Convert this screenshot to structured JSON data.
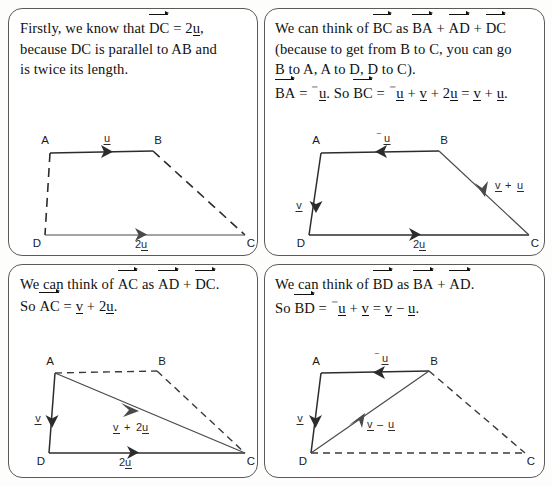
{
  "page": {
    "panel_count": 4
  },
  "panels": [
    {
      "id": "panel-1",
      "name": "panel-dc-equals-2u",
      "text_lines": [
        "Firstly, we know that DC = 2u,",
        "because DC is parallel to AB and",
        "is twice its length."
      ],
      "statement_vector": "DC",
      "statement_result": "2u",
      "diagram": {
        "name": "trapezium-ab-dc",
        "vertices": {
          "A": "A",
          "B": "B",
          "C": "C",
          "D": "D"
        },
        "edge_labels": {
          "AB": "u",
          "DC": "2u"
        },
        "edges": [
          {
            "from": "A",
            "to": "B",
            "style": "solid",
            "arrow": "mid-right",
            "label": "u"
          },
          {
            "from": "A",
            "to": "D",
            "style": "dashed",
            "arrow": "none",
            "label": ""
          },
          {
            "from": "B",
            "to": "C",
            "style": "dashed",
            "arrow": "none",
            "label": ""
          },
          {
            "from": "D",
            "to": "C",
            "style": "solid",
            "arrow": "mid-right",
            "label": "2u"
          }
        ]
      }
    },
    {
      "id": "panel-2",
      "name": "panel-bc-decomposition",
      "text_lines": [
        "We can think of BC as  BA + AD + DC",
        "(because to get from B to C, you can go",
        "B to A, A to D, D to C).",
        "BA = ⁻u.  So BC = ⁻u + v + 2u = v + u."
      ],
      "diagram": {
        "name": "trapezium-bc-route",
        "vertices": {
          "A": "A",
          "B": "B",
          "C": "C",
          "D": "D"
        },
        "edge_labels": {
          "BA": "⁻u",
          "AD": "v",
          "DC": "2u",
          "BC": "v + u"
        },
        "edges": [
          {
            "from": "B",
            "to": "A",
            "style": "solid",
            "arrow": "mid-left",
            "label": "⁻u"
          },
          {
            "from": "A",
            "to": "D",
            "style": "solid",
            "arrow": "mid-down",
            "label": "v"
          },
          {
            "from": "D",
            "to": "C",
            "style": "solid",
            "arrow": "mid-right",
            "label": "2u"
          },
          {
            "from": "B",
            "to": "C",
            "style": "thin",
            "arrow": "mid-diag",
            "label": "v + u"
          }
        ]
      }
    },
    {
      "id": "panel-3",
      "name": "panel-ac-decomposition",
      "text_lines": [
        "We can think of AC as  AD + DC.",
        "So  AC = v + 2u."
      ],
      "diagram": {
        "name": "trapezium-ac-route",
        "vertices": {
          "A": "A",
          "B": "B",
          "C": "C",
          "D": "D"
        },
        "edge_labels": {
          "AD": "v",
          "DC": "2u",
          "AC": "v + 2u"
        },
        "edges": [
          {
            "from": "A",
            "to": "B",
            "style": "dashed",
            "arrow": "none",
            "label": ""
          },
          {
            "from": "B",
            "to": "C",
            "style": "dashed",
            "arrow": "none",
            "label": ""
          },
          {
            "from": "A",
            "to": "D",
            "style": "solid",
            "arrow": "mid-down",
            "label": "v"
          },
          {
            "from": "D",
            "to": "C",
            "style": "solid",
            "arrow": "mid-right",
            "label": "2u"
          },
          {
            "from": "A",
            "to": "C",
            "style": "thin",
            "arrow": "mid-diag",
            "label": "v + 2u"
          }
        ]
      }
    },
    {
      "id": "panel-4",
      "name": "panel-bd-decomposition",
      "text_lines": [
        "We can think of BD as  BA + AD.",
        "So  BD = ⁻u + v = v − u."
      ],
      "diagram": {
        "name": "trapezium-bd-route",
        "vertices": {
          "A": "A",
          "B": "B",
          "C": "C",
          "D": "D"
        },
        "edge_labels": {
          "BA": "⁻u",
          "AD": "v",
          "BD": "v − u"
        },
        "edges": [
          {
            "from": "B",
            "to": "A",
            "style": "solid",
            "arrow": "mid-left",
            "label": "⁻u"
          },
          {
            "from": "A",
            "to": "D",
            "style": "solid",
            "arrow": "mid-down",
            "label": "v"
          },
          {
            "from": "B",
            "to": "C",
            "style": "dashed",
            "arrow": "none",
            "label": ""
          },
          {
            "from": "D",
            "to": "C",
            "style": "dashed",
            "arrow": "none",
            "label": ""
          },
          {
            "from": "B",
            "to": "D",
            "style": "thin",
            "arrow": "mid-diag",
            "label": "v − u"
          }
        ]
      }
    }
  ],
  "labels": {
    "A": "A",
    "B": "B",
    "C": "C",
    "D": "D",
    "u": "u",
    "two_u": "2u",
    "v": "v",
    "neg_u": "u",
    "v_plus_u_v": "v",
    "v_plus_u_op": "+",
    "v_plus_u_u": "u",
    "v_plus_2u_v": "v",
    "v_plus_2u_op": "+",
    "v_plus_2u_2u": "2u",
    "v_minus_u_v": "v",
    "v_minus_u_op": "–",
    "v_minus_u_u": "u",
    "neg_sign": "⁻"
  },
  "text": {
    "p1_l1_a": "Firstly, we know that ",
    "p1_l1_vec": "DC",
    "p1_l1_b": " = 2",
    "p1_l1_u": "u",
    "p1_l1_c": ",",
    "p1_l2": "because DC is parallel to AB and",
    "p1_l3": "is twice its length.",
    "p2_l1_a": "We can think of ",
    "p2_l1_v1": "BC",
    "p2_l1_b": " as  ",
    "p2_l1_v2": "BA",
    "p2_l1_c": " + ",
    "p2_l1_v3": "AD",
    "p2_l1_d": " + ",
    "p2_l1_v4": "DC",
    "p2_l2": "(because to get from B to C, you can go",
    "p2_l3": "B to A, A to D, D to C).",
    "p2_l4_v1": "BA",
    "p2_l4_a": " = ",
    "p2_l4_neg": "⁻",
    "p2_l4_u1": "u",
    "p2_l4_b": ".  So ",
    "p2_l4_v2": "BC",
    "p2_l4_c": " = ",
    "p2_l4_neg2": "⁻",
    "p2_l4_u2": "u",
    "p2_l4_d": " + ",
    "p2_l4_v3": "v",
    "p2_l4_e": " + 2",
    "p2_l4_u3": "u",
    "p2_l4_f": " = ",
    "p2_l4_v4": "v",
    "p2_l4_g": " + ",
    "p2_l4_u4": "u",
    "p2_l4_h": ".",
    "p3_l1_a": "We can think of ",
    "p3_l1_v1": "AC",
    "p3_l1_b": " as  ",
    "p3_l1_v2": "AD",
    "p3_l1_c": " + ",
    "p3_l1_v3": "DC",
    "p3_l1_d": ".",
    "p3_l2_a": "So  ",
    "p3_l2_v1": "AC",
    "p3_l2_b": " = ",
    "p3_l2_v": "v",
    "p3_l2_c": " + 2",
    "p3_l2_u": "u",
    "p3_l2_d": ".",
    "p4_l1_a": "We can think of ",
    "p4_l1_v1": "BD",
    "p4_l1_b": " as  ",
    "p4_l1_v2": "BA",
    "p4_l1_c": " + ",
    "p4_l1_v3": "AD",
    "p4_l1_d": ".",
    "p4_l2_a": "So  ",
    "p4_l2_v1": "BD",
    "p4_l2_b": " = ",
    "p4_l2_neg": "⁻",
    "p4_l2_u1": "u",
    "p4_l2_c": " + ",
    "p4_l2_v1b": "v",
    "p4_l2_d": " = ",
    "p4_l2_v2": "v",
    "p4_l2_e": " − ",
    "p4_l2_u2": "u",
    "p4_l2_f": "."
  },
  "colors": {
    "ink": "#2c2c2c",
    "text": "#111111",
    "panel_border": "#5a5a5a",
    "paper": "#ffffff",
    "thin_line": "#4a4a4a"
  }
}
